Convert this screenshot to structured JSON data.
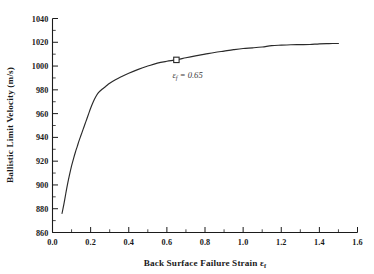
{
  "figure": {
    "background_color": "#ffffff",
    "axis_color": "#1b1b1b",
    "curve_color": "#2a2a2a"
  },
  "chart_data": {
    "type": "line",
    "title": "",
    "subtitle": "",
    "xlabel": "Back Surface Failure Strain εf",
    "xlabel_main": "Back Surface Failure Strain",
    "xlabel_symbol": "ε",
    "xlabel_subscript": "f",
    "ylabel": "Ballistic Limit Velocity (m/s)",
    "xlim": [
      0.0,
      1.6
    ],
    "ylim": [
      860,
      1040
    ],
    "xticks": [
      0.0,
      0.2,
      0.4,
      0.6,
      0.8,
      1.0,
      1.2,
      1.4,
      1.6
    ],
    "xtick_labels": [
      "0.0",
      "0.2",
      "0.4",
      "0.6",
      "0.8",
      "1.0",
      "1.2",
      "1.4",
      "1.6"
    ],
    "yticks": [
      860,
      880,
      900,
      920,
      940,
      960,
      980,
      1000,
      1020,
      1040
    ],
    "ytick_labels": [
      "860",
      "880",
      "900",
      "920",
      "940",
      "960",
      "980",
      "1000",
      "1020",
      "1040"
    ],
    "x_minor_interval": 0.1,
    "y_minor_interval": 10,
    "grid": false,
    "legend": null,
    "series": [
      {
        "name": "Ballistic limit velocity",
        "x": [
          0.05,
          0.06,
          0.07,
          0.08,
          0.09,
          0.1,
          0.11,
          0.12,
          0.13,
          0.14,
          0.15,
          0.16,
          0.17,
          0.18,
          0.19,
          0.2,
          0.21,
          0.22,
          0.23,
          0.24,
          0.26,
          0.28,
          0.3,
          0.33,
          0.36,
          0.4,
          0.45,
          0.5,
          0.55,
          0.6,
          0.65,
          0.7,
          0.75,
          0.8,
          0.85,
          0.9,
          0.95,
          1.0,
          1.05,
          1.1,
          1.15,
          1.2,
          1.25,
          1.3,
          1.35,
          1.4,
          1.45,
          1.5
        ],
        "y": [
          876.0,
          884.0,
          893.0,
          901.5,
          909.0,
          916.0,
          922.0,
          927.5,
          932.5,
          937.5,
          942.0,
          946.5,
          951.0,
          955.5,
          960.0,
          964.5,
          968.5,
          972.0,
          975.0,
          977.5,
          980.5,
          983.0,
          985.5,
          988.5,
          991.0,
          994.0,
          997.2,
          1000.0,
          1002.5,
          1004.0,
          1005.2,
          1007.0,
          1008.6,
          1010.0,
          1011.4,
          1012.6,
          1013.8,
          1014.8,
          1015.3,
          1016.0,
          1017.2,
          1017.6,
          1017.9,
          1018.0,
          1018.1,
          1018.7,
          1018.9,
          1019.0
        ]
      }
    ],
    "annotations": [
      {
        "name": "failure-strain-marker",
        "marker_type": "open-square",
        "x": 0.65,
        "y": 1005.2,
        "label_symbol": "ε",
        "label_subscript": "f",
        "label_value": "= 0.65",
        "label_full": "εf = 0.65"
      }
    ]
  }
}
